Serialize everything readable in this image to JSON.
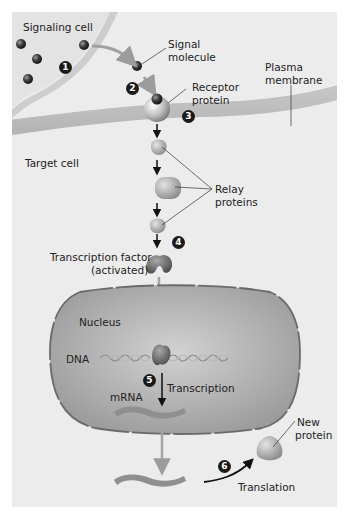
{
  "figure": {
    "background": "#ececec",
    "labels": {
      "signaling_cell": "Signaling cell",
      "signal_molecule_1": "Signal",
      "signal_molecule_2": "molecule",
      "plasma_membrane_1": "Plasma",
      "plasma_membrane_2": "membrane",
      "receptor_protein_1": "Receptor",
      "receptor_protein_2": "protein",
      "target_cell": "Target cell",
      "relay_proteins_1": "Relay",
      "relay_proteins_2": "proteins",
      "transcription_factor_1": "Transcription factor",
      "transcription_factor_2": "(activated)",
      "nucleus": "Nucleus",
      "dna": "DNA",
      "mrna": "mRNA",
      "transcription": "Transcription",
      "new_protein_1": "New",
      "new_protein_2": "protein",
      "translation": "Translation"
    },
    "steps": [
      "1",
      "2",
      "3",
      "4",
      "5",
      "6"
    ]
  }
}
